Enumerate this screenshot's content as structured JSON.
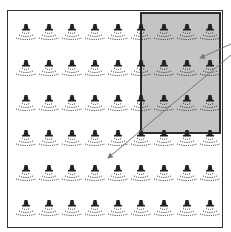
{
  "figure": {
    "type": "layout diagram",
    "grid": {
      "columns": 9,
      "rows": 6,
      "icon": "sprinkler-head-icon",
      "col_x": [
        26,
        49,
        72,
        95,
        118,
        141,
        164,
        187,
        210
      ],
      "row_y": [
        24,
        60,
        95,
        130,
        165,
        200
      ]
    },
    "colors": {
      "frame": "#333333",
      "highlight_fill": "#c4c4c4",
      "highlight_border": "#2a2a2a",
      "icon": "#222222",
      "arrow": "#777777"
    },
    "highlight_region": {
      "columns": "6-9",
      "rows": "1-3"
    },
    "arrows": [
      {
        "from": [
          231,
          44
        ],
        "to": [
          200,
          58
        ]
      },
      {
        "from": [
          231,
          55
        ],
        "to": [
          108,
          158
        ]
      }
    ]
  }
}
